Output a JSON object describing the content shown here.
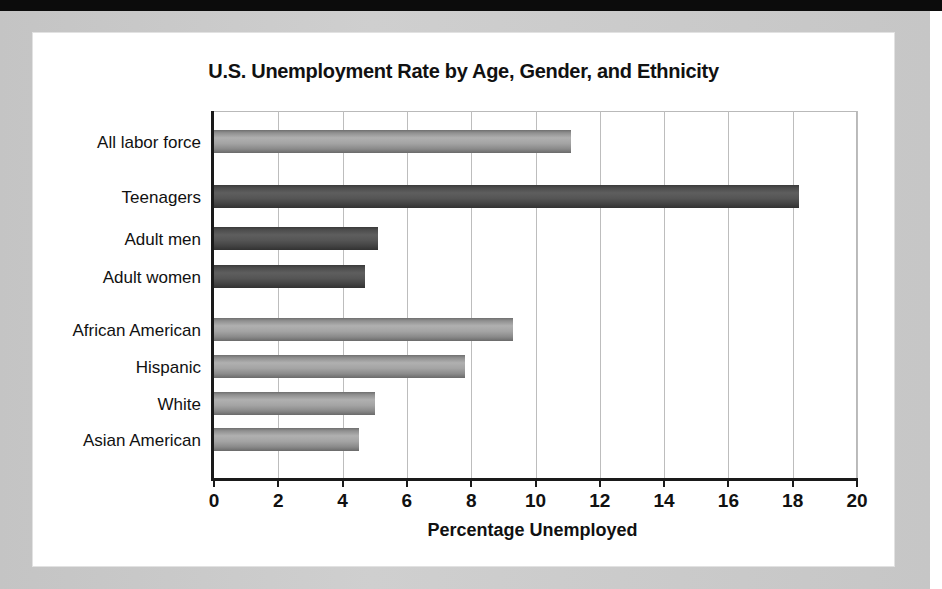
{
  "figure": {
    "title": "U.S. Unemployment Rate by Age, Gender, and Ethnicity"
  },
  "chart_data": {
    "type": "bar",
    "orientation": "horizontal",
    "title": "U.S. Unemployment Rate by Age, Gender, and Ethnicity",
    "xlabel": "Percentage Unemployed",
    "ylabel": "",
    "xlim": [
      0,
      20
    ],
    "xticks": [
      0,
      2,
      4,
      6,
      8,
      10,
      12,
      14,
      16,
      18,
      20
    ],
    "xtick_labels": [
      "0",
      "2",
      "4",
      "6",
      "8",
      "10",
      "12",
      "14",
      "16",
      "18",
      "20"
    ],
    "grid": "vertical",
    "legend": "none",
    "categories": [
      "All labor force",
      "Teenagers",
      "Adult men",
      "Adult women",
      "African American",
      "Hispanic",
      "White",
      "Asian American"
    ],
    "values": [
      11.1,
      18.2,
      5.1,
      4.7,
      9.3,
      7.8,
      5.0,
      4.5
    ],
    "bars": [
      {
        "label": "All labor force",
        "value": 11.1,
        "shade": "light",
        "group": "overall"
      },
      {
        "label": "Teenagers",
        "value": 18.2,
        "shade": "dark",
        "group": "age-gender"
      },
      {
        "label": "Adult men",
        "value": 5.1,
        "shade": "dark",
        "group": "age-gender"
      },
      {
        "label": "Adult women",
        "value": 4.7,
        "shade": "dark",
        "group": "age-gender"
      },
      {
        "label": "African American",
        "value": 9.3,
        "shade": "light",
        "group": "ethnicity"
      },
      {
        "label": "Hispanic",
        "value": 7.8,
        "shade": "light",
        "group": "ethnicity"
      },
      {
        "label": "White",
        "value": 5.0,
        "shade": "light",
        "group": "ethnicity"
      },
      {
        "label": "Asian American",
        "value": 4.5,
        "shade": "light",
        "group": "ethnicity"
      }
    ],
    "colors": {
      "light_bar": "#a4a4a4",
      "dark_bar": "#4c4c4c",
      "axis": "#1a1a1a",
      "gridline": "#bdbdbd",
      "text": "#111111",
      "card_background": "#ffffff",
      "page_frame": "#c9c9c9"
    }
  }
}
